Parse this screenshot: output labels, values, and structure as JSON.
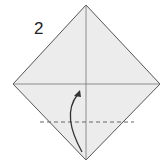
{
  "diagram": {
    "step_number": "2",
    "paper_fill": "#ececec",
    "edge_color": "#555555",
    "crease_color": "#777777",
    "fold_line": "valley-dashed",
    "arrow": "fold-up-arrow"
  }
}
